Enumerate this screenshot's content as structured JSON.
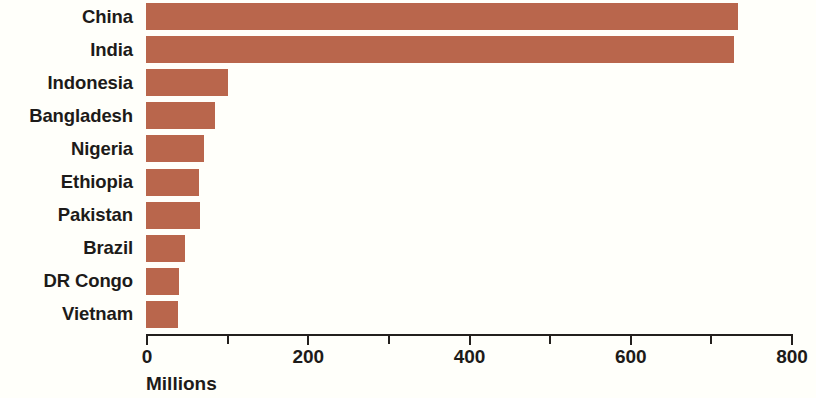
{
  "chart_data": {
    "type": "bar",
    "orientation": "horizontal",
    "title": "",
    "subtitle": "",
    "xlabel": "Millions",
    "ylabel": "",
    "categories": [
      "China",
      "India",
      "Indonesia",
      "Bangladesh",
      "Nigeria",
      "Ethiopia",
      "Pakistan",
      "Brazil",
      "DR Congo",
      "Vietnam"
    ],
    "values": [
      734,
      729,
      102,
      85,
      72,
      66,
      67,
      48,
      41,
      40
    ],
    "xlim": [
      0,
      800
    ],
    "xticks": [
      0,
      100,
      200,
      300,
      400,
      500,
      600,
      700,
      800
    ],
    "xtick_labels": [
      "0",
      "",
      "200",
      "",
      "400",
      "",
      "600",
      "",
      "800"
    ],
    "labeled_xticks": [
      0,
      200,
      400,
      600,
      800
    ],
    "grid": false,
    "legend": null,
    "bar_color": "#b9664c",
    "text_color": "#1d1b19",
    "axis_color": "#23201d",
    "background_color": "#fffffa",
    "series": [
      {
        "name": "Rural population",
        "values": [
          734,
          729,
          102,
          85,
          72,
          66,
          67,
          48,
          41,
          40
        ]
      }
    ]
  },
  "axis": {
    "x_title": "Millions",
    "ticks": [
      {
        "value": 0,
        "label": "0",
        "major": true
      },
      {
        "value": 100,
        "label": "",
        "major": false
      },
      {
        "value": 200,
        "label": "200",
        "major": true
      },
      {
        "value": 300,
        "label": "",
        "major": false
      },
      {
        "value": 400,
        "label": "400",
        "major": true
      },
      {
        "value": 500,
        "label": "",
        "major": false
      },
      {
        "value": 600,
        "label": "600",
        "major": true
      },
      {
        "value": 700,
        "label": "",
        "major": false
      },
      {
        "value": 800,
        "label": "800",
        "major": true
      }
    ]
  },
  "bars": [
    {
      "label": "China",
      "value": 734
    },
    {
      "label": "India",
      "value": 729
    },
    {
      "label": "Indonesia",
      "value": 102
    },
    {
      "label": "Bangladesh",
      "value": 85
    },
    {
      "label": "Nigeria",
      "value": 72
    },
    {
      "label": "Ethiopia",
      "value": 66
    },
    {
      "label": "Pakistan",
      "value": 67
    },
    {
      "label": "Brazil",
      "value": 48
    },
    {
      "label": "DR Congo",
      "value": 41
    },
    {
      "label": "Vietnam",
      "value": 40
    }
  ]
}
